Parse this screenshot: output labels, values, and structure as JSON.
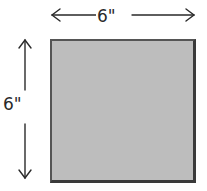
{
  "diagram": {
    "shape": "square",
    "fill_color": "#bdbdbd",
    "outline_color": "#3a3a3a",
    "width_label": "6\"",
    "height_label": "6\"",
    "arrows": [
      {
        "direction": "horizontal",
        "label": "6\""
      },
      {
        "direction": "vertical",
        "label": "6\""
      }
    ]
  }
}
